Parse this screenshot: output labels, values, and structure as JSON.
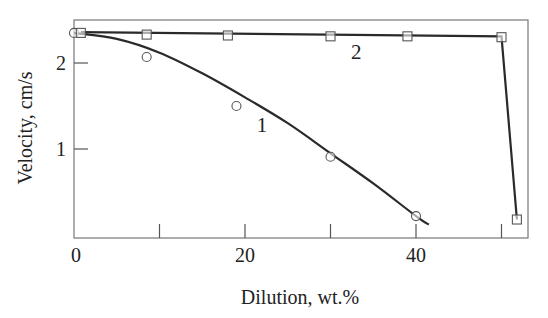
{
  "chart_data": {
    "type": "line",
    "title": "",
    "xlabel": "Dilution, wt.%",
    "ylabel": "Velocity, cm/s",
    "xlim": [
      0,
      54
    ],
    "ylim": [
      0,
      2.45
    ],
    "xticks": [
      0,
      10,
      20,
      30,
      40,
      50
    ],
    "xtick_labels": [
      "0",
      "",
      "20",
      "",
      "40",
      ""
    ],
    "yticks": [
      1,
      2
    ],
    "ytick_labels": [
      "1",
      "2"
    ],
    "grid": false,
    "legend": "inline curve labels",
    "series": [
      {
        "name": "1",
        "marker": "circle",
        "points": [
          [
            0,
            2.35
          ],
          [
            8.5,
            2.07
          ],
          [
            19,
            1.5
          ],
          [
            30,
            0.91
          ],
          [
            40,
            0.22
          ]
        ],
        "curve": [
          [
            0,
            2.35
          ],
          [
            5,
            2.28
          ],
          [
            10,
            2.12
          ],
          [
            15,
            1.88
          ],
          [
            20,
            1.6
          ],
          [
            25,
            1.3
          ],
          [
            30,
            0.95
          ],
          [
            35,
            0.6
          ],
          [
            40,
            0.22
          ],
          [
            41.5,
            0.12
          ]
        ],
        "label_pos": [
          22,
          1.2
        ]
      },
      {
        "name": "2",
        "marker": "square",
        "points": [
          [
            0.8,
            2.35
          ],
          [
            8.5,
            2.33
          ],
          [
            18,
            2.32
          ],
          [
            30,
            2.31
          ],
          [
            39,
            2.31
          ],
          [
            50,
            2.3
          ],
          [
            51.8,
            0.18
          ]
        ],
        "curve": [
          [
            0.8,
            2.36
          ],
          [
            50,
            2.31
          ],
          [
            51.8,
            0.18
          ]
        ],
        "label_pos": [
          33,
          2.05
        ]
      }
    ]
  },
  "axes": {
    "xlabel": "Dilution, wt.%",
    "ylabel": "Velocity, cm/s"
  }
}
